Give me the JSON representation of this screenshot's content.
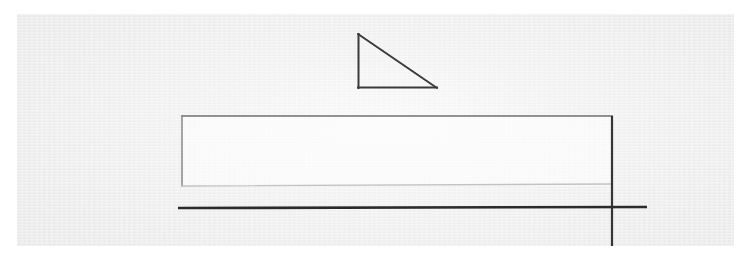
{
  "document": {
    "kind": "scanned-line-drawing",
    "page_background": "#ffffff",
    "paper_background": "#ececed",
    "paper_bounds": {
      "x": 17,
      "y": 14,
      "width": 717,
      "height": 232
    }
  },
  "drawing": {
    "ink_dark": "#2b2b2b",
    "ink_medium": "#6e6e6e",
    "ink_light": "#b9b9bb",
    "shapes": [
      {
        "name": "right-triangle",
        "type": "polyline",
        "stroke": "#3a3a3a",
        "stroke_width": 2.0,
        "points": "358,34 358,88 437,88 358,34",
        "vertices": [
          {
            "label": "apex",
            "x": 358,
            "y": 34
          },
          {
            "label": "right-angle",
            "x": 358,
            "y": 88
          },
          {
            "label": "base-right",
            "x": 437,
            "y": 88
          }
        ]
      },
      {
        "name": "long-rectangle",
        "type": "rect-path",
        "stroke_top": "#707070",
        "stroke_sides": "#808080",
        "stroke_bottom": "#c2c2c4",
        "stroke_width": 1.4,
        "corners": {
          "top_left": {
            "x": 182,
            "y": 116
          },
          "top_right": {
            "x": 612,
            "y": 116
          },
          "bottom_right": {
            "x": 612,
            "y": 184
          },
          "bottom_left": {
            "x": 182,
            "y": 186
          }
        }
      },
      {
        "name": "thick-baseline",
        "type": "line",
        "stroke": "#2b2b2b",
        "stroke_width": 2.6,
        "x1": 178,
        "y1": 208,
        "x2": 647,
        "y2": 207
      },
      {
        "name": "vertical-axis-line",
        "type": "line",
        "stroke": "#353535",
        "stroke_width": 2.2,
        "x1": 612,
        "y1": 116,
        "x2": 612,
        "y2": 246
      },
      {
        "name": "crosshair-intersection",
        "type": "point",
        "x": 612,
        "y": 207
      }
    ]
  }
}
